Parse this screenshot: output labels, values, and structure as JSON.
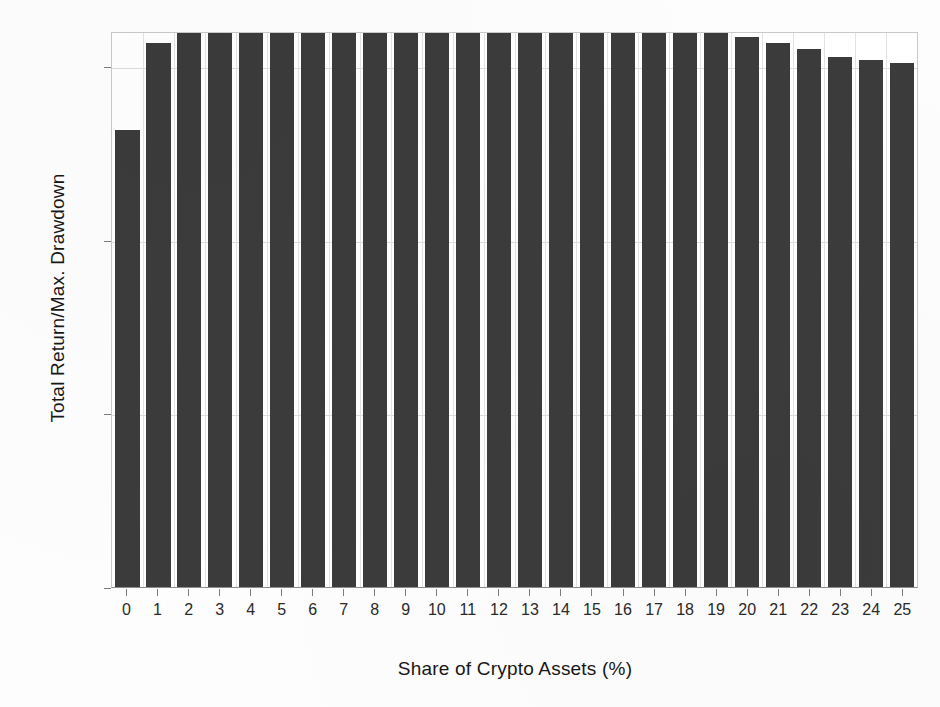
{
  "chart_data": {
    "type": "bar",
    "title": "",
    "xlabel": "Share of Crypto Assets (%)",
    "ylabel": "Total Return/Max. Drawdown",
    "categories": [
      "0",
      "1",
      "2",
      "3",
      "4",
      "5",
      "6",
      "7",
      "8",
      "9",
      "10",
      "11",
      "12",
      "13",
      "14",
      "15",
      "16",
      "17",
      "18",
      "19",
      "20",
      "21",
      "22",
      "23",
      "24",
      "25"
    ],
    "values": [
      6.9,
      8.4,
      9.2,
      9.45,
      9.55,
      9.57,
      9.55,
      9.54,
      9.52,
      9.47,
      9.4,
      9.3,
      9.2,
      9.12,
      9.0,
      8.95,
      8.9,
      8.85,
      8.75,
      8.65,
      8.5,
      8.4,
      8.3,
      8.15,
      8.1,
      8.05
    ],
    "ytick_labels": [
      "0%",
      "2%",
      "5%",
      "8%"
    ],
    "ytick_values": [
      0,
      2,
      5,
      8
    ],
    "ylim": [
      0,
      10.0
    ],
    "grid": true,
    "legend": "none",
    "bar_color": "#3b3b3b",
    "gridline_color": "#dcdcdc",
    "axis_color": "#8d8d8d",
    "background": "#ffffff"
  }
}
